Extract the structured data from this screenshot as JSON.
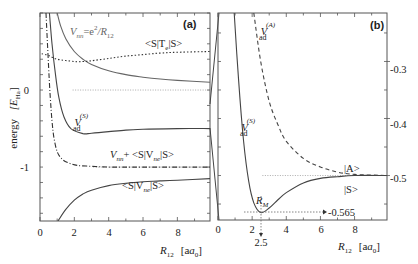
{
  "chart_data": [
    {
      "id": "a",
      "type": "line",
      "panel_label": "(a)",
      "title": "",
      "xlabel": "R12 [a0]",
      "ylabel": "energy [E_Ha]",
      "xlim": [
        0,
        9.9
      ],
      "ylim": [
        -1.7,
        1.0
      ],
      "x_ticks": [
        0,
        2,
        4,
        6,
        8
      ],
      "y_ticks": [
        0,
        -1
      ],
      "y_minor_step": 0.2,
      "grid": false,
      "reference_lines": [
        {
          "y": 0,
          "style": "dotted"
        },
        {
          "y": -1,
          "style": "dotted"
        }
      ],
      "series": [
        {
          "name": "V_nn = e^2/R12",
          "style": "solid",
          "color": "#666666",
          "x": [
            1.0,
            1.2,
            1.5,
            2.0,
            2.5,
            3.0,
            4.0,
            5.0,
            6.0,
            7.0,
            8.0,
            9.9
          ],
          "y": [
            1.0,
            0.833,
            0.667,
            0.5,
            0.4,
            0.333,
            0.25,
            0.2,
            0.167,
            0.143,
            0.125,
            0.101
          ]
        },
        {
          "name": "<S|T_e|S>",
          "style": "dotted",
          "color": "#333333",
          "x": [
            0.1,
            0.5,
            1.0,
            2.0,
            2.5,
            3.0,
            4.0,
            5.0,
            6.0,
            7.0,
            8.0,
            9.9
          ],
          "y": [
            0.47,
            0.45,
            0.4,
            0.37,
            0.37,
            0.38,
            0.41,
            0.44,
            0.46,
            0.48,
            0.49,
            0.5
          ]
        },
        {
          "name": "V_ad^(S)",
          "style": "solid",
          "color": "#444444",
          "x": [
            0.55,
            0.7,
            0.9,
            1.1,
            1.4,
            1.8,
            2.5,
            3.0,
            4.0,
            5.0,
            6.0,
            8.0,
            9.9
          ],
          "y": [
            1.0,
            0.6,
            0.2,
            -0.1,
            -0.35,
            -0.5,
            -0.565,
            -0.56,
            -0.54,
            -0.52,
            -0.51,
            -0.5,
            -0.5
          ]
        },
        {
          "name": "V_nn + <S|V_ne|S>",
          "style": "dashdot",
          "color": "#333333",
          "x": [
            0.35,
            0.5,
            0.6,
            0.7,
            0.8,
            1.0,
            1.3,
            1.7,
            2.2,
            3.0,
            4.0,
            6.0,
            9.9
          ],
          "y": [
            1.0,
            0.3,
            -0.1,
            -0.4,
            -0.6,
            -0.8,
            -0.9,
            -0.95,
            -0.98,
            -0.99,
            -1.0,
            -1.0,
            -1.0
          ]
        },
        {
          "name": "<S|V_ne|S>",
          "style": "solid",
          "color": "#444444",
          "x": [
            1.05,
            1.5,
            2.0,
            2.5,
            3.0,
            4.0,
            5.0,
            6.0,
            7.0,
            8.0,
            9.9
          ],
          "y": [
            -1.7,
            -1.55,
            -1.43,
            -1.35,
            -1.3,
            -1.24,
            -1.21,
            -1.19,
            -1.18,
            -1.17,
            -1.15
          ]
        }
      ],
      "annotations": [
        {
          "text": "V_nn = e^2/R12",
          "x": 3.1,
          "y": 0.78
        },
        {
          "text": "<S|T_e|S>",
          "x": 7.7,
          "y": 0.6
        },
        {
          "text": "V_ad^(S)",
          "x": 2.1,
          "y": -0.47
        },
        {
          "text": "V_nn + <S|V_ne|S>",
          "x": 6.2,
          "y": -0.87
        },
        {
          "text": "<S|V_ne|S>",
          "x": 5.9,
          "y": -1.4
        }
      ]
    },
    {
      "id": "b",
      "type": "line",
      "panel_label": "(b)",
      "title": "",
      "xlabel": "R12 [a0]",
      "ylabel": "",
      "xlim": [
        0,
        9.9
      ],
      "ylim": [
        -0.578,
        -0.215
      ],
      "x_ticks": [
        0,
        2,
        4,
        6,
        8
      ],
      "y_ticks": [
        -0.3,
        -0.4,
        -0.5
      ],
      "y_axis_position": "right",
      "grid": false,
      "reference_lines": [
        {
          "y": -0.5,
          "style": "dotted"
        }
      ],
      "series": [
        {
          "name": "V_ad^(S)",
          "style": "solid",
          "color": "#444444",
          "x": [
            0.95,
            1.2,
            1.5,
            1.8,
            2.1,
            2.5,
            3.0,
            3.5,
            4.0,
            5.0,
            6.0,
            7.0,
            8.0,
            9.9
          ],
          "y": [
            -0.215,
            -0.33,
            -0.44,
            -0.51,
            -0.548,
            -0.565,
            -0.557,
            -0.543,
            -0.53,
            -0.513,
            -0.505,
            -0.502,
            -0.5,
            -0.5
          ]
        },
        {
          "name": "V_ad^(A)",
          "style": "dashed",
          "color": "#444444",
          "x": [
            2.1,
            2.5,
            3.0,
            3.5,
            4.0,
            5.0,
            6.0,
            7.0,
            8.0,
            9.9
          ],
          "y": [
            -0.215,
            -0.3,
            -0.37,
            -0.41,
            -0.44,
            -0.47,
            -0.485,
            -0.494,
            -0.498,
            -0.5
          ]
        }
      ],
      "annotations": [
        {
          "text": "V_ad^(A)",
          "x": 2.25,
          "y": -0.245
        },
        {
          "text": "V_ad^(S)",
          "x": 1.3,
          "y": -0.4
        },
        {
          "text": "|A>",
          "x": 7.5,
          "y": -0.485
        },
        {
          "text": "|S>",
          "x": 7.5,
          "y": -0.52
        },
        {
          "text": "R_M",
          "x": 2.0,
          "y": -0.542
        },
        {
          "text": "-0.565",
          "x": 6.3,
          "y": -0.565
        },
        {
          "text": "2.5",
          "x": 2.5,
          "y": "below-axis"
        }
      ],
      "minimum": {
        "x": 2.5,
        "y": -0.565,
        "label": "R_M"
      }
    }
  ],
  "labels": {
    "panel_a": "(a)",
    "panel_b": "(b)",
    "ylabel_a": "energy",
    "ylabel_a_unit": "[E",
    "ylabel_a_unit_sub": "Ha",
    "ylabel_a_unit_close": "]",
    "xlabel_R": "R",
    "xlabel_sub": "12",
    "xlabel_unit": "[a",
    "xlabel_unit_sub": "0",
    "xlabel_unit_close": "]",
    "a_xticks": [
      "0",
      "2",
      "4",
      "6",
      "8"
    ],
    "a_yticks": [
      "0",
      "-1"
    ],
    "b_xticks": [
      "0",
      "2",
      "4",
      "6",
      "8"
    ],
    "b_yticks": [
      "-0.3",
      "-0.4",
      "-0.5"
    ],
    "vnn_label_V": "V",
    "vnn_label_sub": "nn",
    "vnn_label_rest": "=e",
    "vnn_label_sup": "2",
    "vnn_label_tail": "/R",
    "vnn_label_tailsub": "12",
    "te_label_a": "<S|T",
    "te_label_sub": "e",
    "te_label_b": "|S>",
    "vad_V": "V",
    "vad_sub": "ad",
    "vad_sup_S": "(S)",
    "vad_sup_A": "(A)",
    "vnnvne_V": "V",
    "vnnvne_sub": "nn",
    "vnnvne_rest": "+ <S|V",
    "vnnvne_sub2": "ne",
    "vnnvne_tail": "|S>",
    "vne_a": "<S|V",
    "vne_sub": "ne",
    "vne_b": "|S>",
    "ket_A": "|A>",
    "ket_S": "|S>",
    "rm_R": "R",
    "rm_sub": "M",
    "min_value": "-0.565",
    "min_position": "2.5"
  }
}
